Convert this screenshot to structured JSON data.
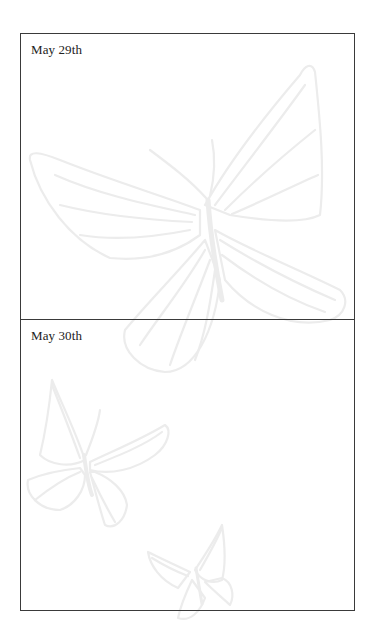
{
  "journal": {
    "entries": [
      {
        "date": "May 29th",
        "body": ""
      },
      {
        "date": "May 30th",
        "body": ""
      }
    ]
  },
  "decor": {
    "watermark_icon": "butterfly-icon",
    "watermark_color": "#ececec",
    "border_color": "#3a3a3a"
  }
}
